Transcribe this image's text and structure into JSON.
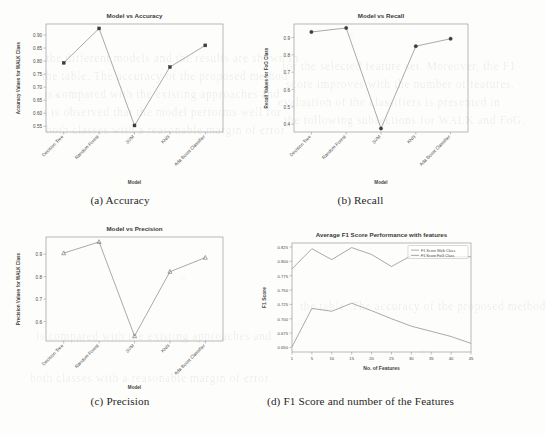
{
  "page": {
    "background": "#fdfdfb",
    "line_color": "#8d8d8d",
    "marker_color": "#3c3c3c",
    "axis_color": "#9a9a9a"
  },
  "bleed_text": [
    "the different models and the results are shown in",
    "the table. The accuracy of the proposed method",
    "is compared with the existing approaches and",
    "it is observed that the model performs well for",
    "both classes with a reasonable margin of error.",
    "for the selected feature set. Moreover, the F1",
    "score improves with the number of features.",
    "evaluation of the classifiers is presented in",
    "the following subsections for WALK and FoG."
  ],
  "figures": [
    {
      "id": "accuracy",
      "caption": "(a) Accuracy",
      "chart_data": {
        "type": "line",
        "title": "Model vs Accuracy",
        "xlabel": "Model",
        "ylabel": "Accuracy Values for WALK Class",
        "categories": [
          "Decision Tree",
          "Random Forest",
          "SVM",
          "KNN",
          "Ada Boost Classifier"
        ],
        "values": [
          0.793,
          0.925,
          0.553,
          0.777,
          0.86
        ],
        "yticks": [
          0.55,
          0.6,
          0.65,
          0.7,
          0.75,
          0.8,
          0.85,
          0.9
        ],
        "ytick_labels": [
          "0.55",
          "0.60",
          "0.65",
          "0.70",
          "0.75",
          "0.80",
          "0.85",
          "0.90"
        ],
        "ylim": [
          0.528,
          0.942
        ],
        "grid": false,
        "legend": null,
        "marker": "filled-square"
      }
    },
    {
      "id": "recall",
      "caption": "(b) Recall",
      "chart_data": {
        "type": "line",
        "title": "Model vs Recall",
        "xlabel": "Model",
        "ylabel": "Recall Values for FoG Class",
        "categories": [
          "Decision Tree",
          "Random Forest",
          "SVM",
          "KNN",
          "Ada Boost Classifier"
        ],
        "values": [
          0.932,
          0.955,
          0.375,
          0.85,
          0.893
        ],
        "yticks": [
          0.4,
          0.5,
          0.6,
          0.7,
          0.8,
          0.9
        ],
        "ytick_labels": [
          "0.4",
          "0.5",
          "0.6",
          "0.7",
          "0.8",
          "0.9"
        ],
        "ylim": [
          0.355,
          0.978
        ],
        "grid": false,
        "legend": null,
        "marker": "filled-circle"
      }
    },
    {
      "id": "precision",
      "caption": "(c) Precision",
      "chart_data": {
        "type": "line",
        "title": "Model vs Precision",
        "xlabel": "Model",
        "ylabel": "Precision Values for WALK Class",
        "categories": [
          "Decision Tree",
          "Random Forest",
          "SVM",
          "KNN",
          "Ada Boost Classifier"
        ],
        "values": [
          0.905,
          0.955,
          0.535,
          0.822,
          0.885
        ],
        "yticks": [
          0.6,
          0.7,
          0.8,
          0.9
        ],
        "ytick_labels": [
          "0.6",
          "0.7",
          "0.8",
          "0.9"
        ],
        "ylim": [
          0.513,
          0.977
        ],
        "grid": false,
        "legend": null,
        "marker": "hollow-triangle"
      }
    },
    {
      "id": "f1-features",
      "caption": "(d) F1 Score and number of the Features",
      "chart_data": {
        "type": "line",
        "title": "Average F1 Score Performance with features",
        "xlabel": "No. of Features",
        "ylabel": "F1 Score",
        "x": [
          1,
          5,
          10,
          15,
          20,
          25,
          30,
          35,
          40,
          45
        ],
        "xtick_labels": [
          "1",
          "5",
          "10",
          "15",
          "20",
          "25",
          "30",
          "35",
          "40",
          "45"
        ],
        "series": [
          {
            "name": "F1 Score Walk Class",
            "values": [
              0.787,
              0.822,
              0.803,
              0.824,
              0.812,
              0.791,
              0.81,
              0.809,
              0.808,
              0.808
            ]
          },
          {
            "name": "F1 Score FoG Class",
            "values": [
              0.651,
              0.718,
              0.713,
              0.727,
              0.714,
              0.7,
              0.687,
              0.678,
              0.669,
              0.657
            ]
          }
        ],
        "yticks": [
          0.65,
          0.675,
          0.7,
          0.725,
          0.75,
          0.775,
          0.8,
          0.825
        ],
        "ytick_labels": [
          "0.650",
          "0.675",
          "0.700",
          "0.725",
          "0.750",
          "0.775",
          "0.800",
          "0.825"
        ],
        "ylim": [
          0.642,
          0.832
        ],
        "xlim": [
          1,
          45
        ],
        "grid": false,
        "legend_position": "upper-right"
      }
    }
  ]
}
